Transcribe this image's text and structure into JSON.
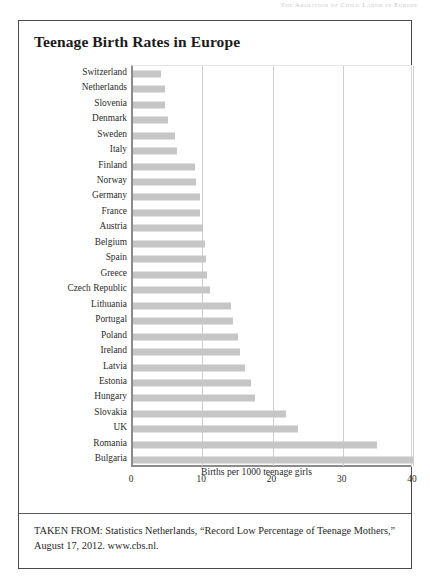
{
  "page": {
    "running_header": "The Abolition of Child Labor in Europe"
  },
  "figure": {
    "title": "Teenage Birth Rates in Europe",
    "caption": "TAKEN FROM: Statistics Netherlands, “Record Low Percentage of Teenage Mothers,” August 17, 2012. www.cbs.nl."
  },
  "colors": {
    "bar": "#c6c6c6",
    "frame": "#4a4a4a",
    "gridline": "#cfcfcf",
    "text": "#1f1f1f"
  },
  "chart_data": {
    "type": "bar",
    "orientation": "horizontal",
    "title": "Teenage Birth Rates in Europe",
    "xlabel": "Births per 1000 teenage girls",
    "ylabel": "",
    "xlim": [
      0,
      40
    ],
    "xticks": [
      0,
      10,
      20,
      30,
      40
    ],
    "xtick_labels": [
      "0",
      "10",
      "20",
      "30",
      "40"
    ],
    "grid": "vertical",
    "legend": "none",
    "categories": [
      "Switzerland",
      "Netherlands",
      "Slovenia",
      "Denmark",
      "Sweden",
      "Italy",
      "Finland",
      "Norway",
      "Germany",
      "France",
      "Austria",
      "Belgium",
      "Spain",
      "Greece",
      "Czech Republic",
      "Lithuania",
      "Portugal",
      "Poland",
      "Ireland",
      "Latvia",
      "Estonia",
      "Hungary",
      "Slovakia",
      "UK",
      "Romania",
      "Bulgaria"
    ],
    "values": [
      4.0,
      4.5,
      4.6,
      5.0,
      6.0,
      6.2,
      8.8,
      8.9,
      9.5,
      9.6,
      10.0,
      10.2,
      10.4,
      10.6,
      11.0,
      14.0,
      14.2,
      15.0,
      15.2,
      16.0,
      16.8,
      17.3,
      21.8,
      23.5,
      34.7,
      39.8
    ]
  }
}
